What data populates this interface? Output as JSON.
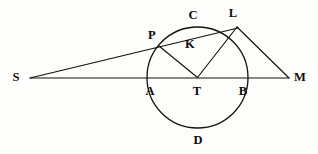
{
  "figure": {
    "canvas": {
      "width": 318,
      "height": 154
    },
    "background_color": "#fdfdfb",
    "ink_color": "#14110f"
  },
  "circle": {
    "name": "main-circle",
    "center": {
      "x": 197.5,
      "y": 77.5
    },
    "radius": 50.5,
    "stroke_width": 1.3
  },
  "points": [
    {
      "id": "S",
      "label": "S",
      "x": 30,
      "y": 78,
      "label_x": 16,
      "label_y": 77
    },
    {
      "id": "M",
      "label": "M",
      "x": 289,
      "y": 78,
      "label_x": 300,
      "label_y": 77
    },
    {
      "id": "A",
      "label": "A",
      "x": 147,
      "y": 77.5,
      "label_x": 150,
      "label_y": 91
    },
    {
      "id": "B",
      "label": "B",
      "x": 248,
      "y": 77.5,
      "label_x": 243,
      "label_y": 91
    },
    {
      "id": "T",
      "label": "T",
      "x": 197.5,
      "y": 77.5,
      "label_x": 197,
      "label_y": 91
    },
    {
      "id": "C",
      "label": "C",
      "x": 192,
      "y": 27,
      "label_x": 193,
      "label_y": 15
    },
    {
      "id": "D",
      "label": "D",
      "x": 197.5,
      "y": 128,
      "label_x": 198,
      "label_y": 140
    },
    {
      "id": "P",
      "label": "P",
      "x": 159,
      "y": 46,
      "label_x": 152,
      "label_y": 35
    },
    {
      "id": "L",
      "label": "L",
      "x": 237,
      "y": 27,
      "label_x": 233,
      "label_y": 13
    },
    {
      "id": "K",
      "label": "K",
      "x": 190,
      "y": 48,
      "label_x": 190,
      "label_y": 44
    }
  ],
  "segments": [
    {
      "id": "S-M",
      "name": "baseline-s-to-m",
      "from": "S",
      "to": "M",
      "x1": 30,
      "y1": 78,
      "x2": 289,
      "y2": 78,
      "width": 1.1
    },
    {
      "id": "S-L",
      "name": "secant-s-through-p-to-l",
      "from": "S",
      "to": "L",
      "x1": 30,
      "y1": 78,
      "x2": 238,
      "y2": 28,
      "width": 1.15
    },
    {
      "id": "T-P",
      "name": "radius-t-to-p",
      "from": "T",
      "to": "P",
      "x1": 197.5,
      "y1": 77.5,
      "x2": 159,
      "y2": 46,
      "width": 1.15
    },
    {
      "id": "T-L",
      "name": "radius-t-to-l",
      "from": "T",
      "to": "L",
      "x1": 197.5,
      "y1": 77.5,
      "x2": 237,
      "y2": 27,
      "width": 1.15
    },
    {
      "id": "L-M",
      "name": "line-l-to-m",
      "from": "L",
      "to": "M",
      "x1": 237,
      "y1": 27,
      "x2": 289,
      "y2": 78,
      "width": 1.15
    }
  ],
  "labels": {
    "S": "S",
    "M": "M",
    "A": "A",
    "B": "B",
    "T": "T",
    "C": "C",
    "D": "D",
    "P": "P",
    "L": "L",
    "K": "K"
  }
}
